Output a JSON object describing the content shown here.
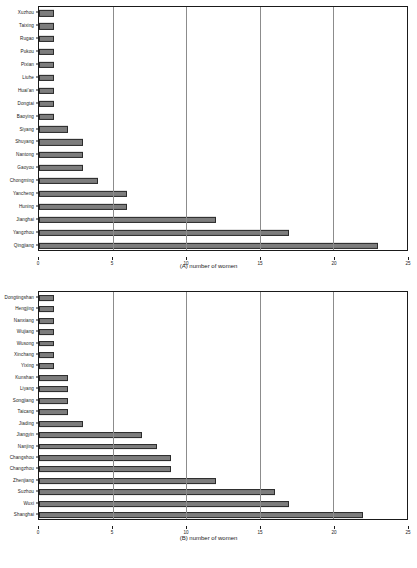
{
  "figure": {
    "background": "#ffffff",
    "bar_fill": "#7d7d7d",
    "bar_stroke": "#2b2b2b",
    "grid_color": "#8c8c8c",
    "axis_color": "#1a1a1a",
    "top_clipped_caption": ""
  },
  "chart_data": [
    {
      "type": "bar",
      "orientation": "horizontal",
      "panel": "A",
      "title": "",
      "xlabel": "(A) number of women",
      "ylabel": "",
      "xlim": [
        0,
        25
      ],
      "xticks": [
        0,
        5,
        10,
        15,
        20,
        25
      ],
      "xtick_labels": [
        "0",
        "5",
        "10",
        "15",
        "20",
        "25"
      ],
      "gridlines_at": [
        5,
        10,
        15,
        20
      ],
      "grid": true,
      "legend": "none",
      "categories": [
        "Xuzhou",
        "Taixing",
        "Rugao",
        "Pukou",
        "Pixian",
        "Liuhe",
        "Huai'an",
        "Dongtai",
        "Baoying",
        "Siyang",
        "Shuyang",
        "Nantong",
        "Gaoyou",
        "Chongming",
        "Yancheng",
        "Huning",
        "Jianghai",
        "Yangzhou",
        "Qingjiang"
      ],
      "values": [
        1,
        1,
        1,
        1,
        1,
        1,
        1,
        1,
        1,
        2,
        3,
        3,
        3,
        4,
        6,
        6,
        12,
        17,
        23
      ]
    },
    {
      "type": "bar",
      "orientation": "horizontal",
      "panel": "B",
      "title": "",
      "xlabel": "(B) number of women",
      "ylabel": "",
      "xlim": [
        0,
        25
      ],
      "xticks": [
        0,
        5,
        10,
        15,
        20,
        25
      ],
      "xtick_labels": [
        "0",
        "5",
        "10",
        "15",
        "20",
        "25"
      ],
      "gridlines_at": [
        5,
        10,
        15,
        20
      ],
      "grid": true,
      "legend": "none",
      "categories": [
        "Dongtingshan",
        "Hengjing",
        "Nanxiang",
        "Wujiang",
        "Wusong",
        "Xinchang",
        "Yixing",
        "Kunshan",
        "Liyang",
        "Songjiang",
        "Taicang",
        "Jiading",
        "Jiangyin",
        "Nanjing",
        "Changshou",
        "Changzhou",
        "Zhenjiang",
        "Suzhou",
        "Wuxi",
        "Shanghai"
      ],
      "values": [
        1,
        1,
        1,
        1,
        1,
        1,
        1,
        2,
        2,
        2,
        2,
        3,
        7,
        8,
        9,
        9,
        12,
        16,
        17,
        22
      ]
    }
  ]
}
